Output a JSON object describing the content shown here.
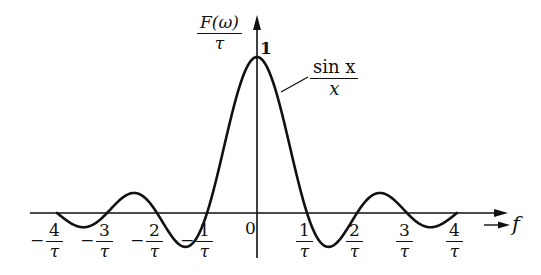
{
  "title": "",
  "y_axis_label": {
    "numerator": "F(ω)",
    "denominator": "τ"
  },
  "x_axis_label": "f",
  "peak_label": "1",
  "origin_label": "0",
  "curve_label": {
    "numerator": "sin x",
    "denominator": "x"
  },
  "x_ticks": [
    {
      "sign": "−",
      "num": "4",
      "den": "τ"
    },
    {
      "sign": "−",
      "num": "3",
      "den": "τ"
    },
    {
      "sign": "−",
      "num": "2",
      "den": "τ"
    },
    {
      "sign": "−",
      "num": "1",
      "den": "τ"
    },
    {
      "sign": "",
      "num": "1",
      "den": "τ"
    },
    {
      "sign": "",
      "num": "2",
      "den": "τ"
    },
    {
      "sign": "",
      "num": "3",
      "den": "τ"
    },
    {
      "sign": "",
      "num": "4",
      "den": "τ"
    }
  ],
  "colors": {
    "line": "#111111",
    "background": "#ffffff"
  },
  "chart_data": {
    "type": "line",
    "title": "",
    "xlabel": "f",
    "ylabel": "F(ω)/τ",
    "function": "sin(x)/x, x = π f τ",
    "x_units": "1/τ",
    "x": [
      -4,
      -3.5,
      -3,
      -2.5,
      -2,
      -1.5,
      -1,
      -0.5,
      0,
      0.5,
      1,
      1.5,
      2,
      2.5,
      3,
      3.5,
      4
    ],
    "y": [
      0,
      -0.091,
      0,
      0.127,
      0,
      -0.212,
      0,
      0.637,
      1,
      0.637,
      0,
      -0.212,
      0,
      0.127,
      0,
      -0.091,
      0
    ],
    "xlim": [
      -4,
      4
    ],
    "ylim": [
      -0.22,
      1
    ],
    "zero_crossings": [
      -4,
      -3,
      -2,
      -1,
      1,
      2,
      3,
      4
    ],
    "peak": {
      "x": 0,
      "y": 1
    },
    "grid": false,
    "legend": "none",
    "annotations": [
      "sin x / x (curve label with leader line)",
      "1 (peak value)",
      "0 (origin)"
    ]
  }
}
